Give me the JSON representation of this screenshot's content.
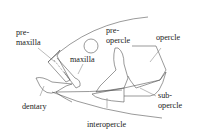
{
  "diagram": {
    "type": "anatomical-labeled-figure",
    "labels": {
      "premaxilla_line1": "pre-",
      "premaxilla_line2": "maxilla",
      "maxilla": "maxilla",
      "preopercle_line1": "pre-",
      "preopercle_line2": "opercle",
      "opercle": "opercle",
      "dentary": "dentary",
      "subopercle_line1": "sub-",
      "subopercle_line2": "opercle",
      "interopercle": "interopercle"
    },
    "colors": {
      "line": "#555555",
      "text": "#222222",
      "background": "#ffffff"
    }
  }
}
